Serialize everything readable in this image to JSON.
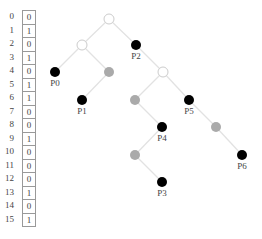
{
  "table": {
    "rows": [
      {
        "index": "0",
        "value": "0"
      },
      {
        "index": "1",
        "value": "1"
      },
      {
        "index": "2",
        "value": "0"
      },
      {
        "index": "3",
        "value": "1"
      },
      {
        "index": "4",
        "value": "0"
      },
      {
        "index": "5",
        "value": "1"
      },
      {
        "index": "6",
        "value": "1"
      },
      {
        "index": "7",
        "value": "0"
      },
      {
        "index": "8",
        "value": "0"
      },
      {
        "index": "9",
        "value": "1"
      },
      {
        "index": "10",
        "value": "0"
      },
      {
        "index": "11",
        "value": "0"
      },
      {
        "index": "12",
        "value": "0"
      },
      {
        "index": "13",
        "value": "1"
      },
      {
        "index": "14",
        "value": "0"
      },
      {
        "index": "15",
        "value": "1"
      }
    ]
  },
  "tree": {
    "colors": {
      "edge": "#e2e2e2",
      "empty_fill": "#ffffff",
      "empty_stroke": "#cccccc",
      "leaf": "#000000",
      "gray": "#aaaaaa"
    },
    "nodes": [
      {
        "id": "n0",
        "x": 109,
        "y": 19,
        "kind": "empty"
      },
      {
        "id": "n1",
        "x": 82,
        "y": 45,
        "kind": "empty"
      },
      {
        "id": "p2",
        "x": 136,
        "y": 45,
        "kind": "leaf",
        "label": "P2"
      },
      {
        "id": "p0",
        "x": 55,
        "y": 72,
        "kind": "leaf",
        "label": "P0"
      },
      {
        "id": "g1",
        "x": 109,
        "y": 72,
        "kind": "gray"
      },
      {
        "id": "n2",
        "x": 163,
        "y": 72,
        "kind": "empty"
      },
      {
        "id": "p1",
        "x": 82,
        "y": 100,
        "kind": "leaf",
        "label": "P1"
      },
      {
        "id": "g2",
        "x": 135,
        "y": 100,
        "kind": "gray"
      },
      {
        "id": "p5",
        "x": 189,
        "y": 100,
        "kind": "leaf",
        "label": "P5"
      },
      {
        "id": "p4",
        "x": 162,
        "y": 127,
        "kind": "leaf",
        "label": "P4"
      },
      {
        "id": "g3",
        "x": 216,
        "y": 127,
        "kind": "gray"
      },
      {
        "id": "g4",
        "x": 135,
        "y": 155,
        "kind": "gray"
      },
      {
        "id": "p6",
        "x": 242,
        "y": 155,
        "kind": "leaf",
        "label": "P6"
      },
      {
        "id": "p3",
        "x": 162,
        "y": 182,
        "kind": "leaf",
        "label": "P3"
      }
    ],
    "edges": [
      [
        "n0",
        "n1"
      ],
      [
        "n0",
        "p2"
      ],
      [
        "n1",
        "p0"
      ],
      [
        "n1",
        "g1"
      ],
      [
        "p2",
        "n2"
      ],
      [
        "g1",
        "p1"
      ],
      [
        "n2",
        "g2"
      ],
      [
        "n2",
        "p5"
      ],
      [
        "g2",
        "p4"
      ],
      [
        "p5",
        "g3"
      ],
      [
        "p4",
        "g4"
      ],
      [
        "g3",
        "p6"
      ],
      [
        "g4",
        "p3"
      ]
    ]
  }
}
